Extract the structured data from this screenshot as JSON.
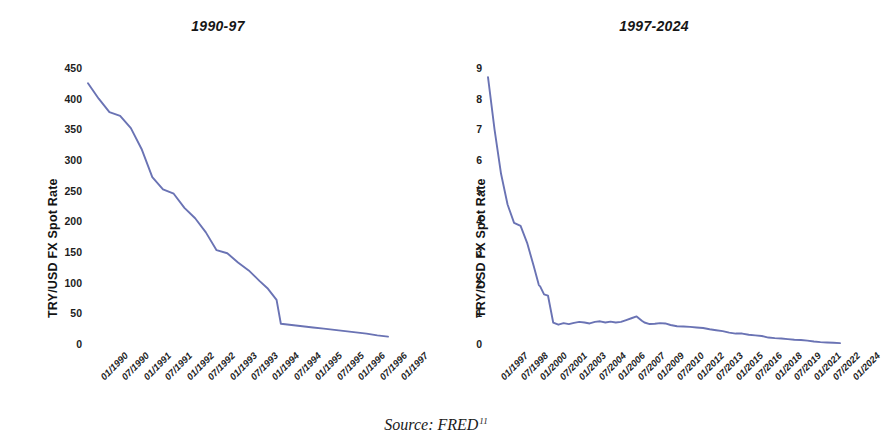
{
  "figure": {
    "source_prefix": "Source: FRED",
    "source_footnote": "11",
    "line_color": "#6a73b4"
  },
  "chart_data": [
    {
      "type": "line",
      "title": "1990-97",
      "xlabel": "",
      "ylabel": "TRY/USD FX Spot Rate",
      "ylim": [
        0,
        450
      ],
      "yticks": [
        0,
        50,
        100,
        150,
        200,
        250,
        300,
        350,
        400,
        450
      ],
      "grid": false,
      "legend": "none",
      "categories": [
        "01/1990",
        "07/1990",
        "01/1991",
        "07/1991",
        "01/1992",
        "07/1992",
        "01/1993",
        "07/1993",
        "01/1994",
        "07/1994",
        "01/1995",
        "07/1995",
        "01/1996",
        "07/1996",
        "01/1997"
      ],
      "x": [
        1990.0,
        1990.25,
        1990.5,
        1990.75,
        1991.0,
        1991.25,
        1991.5,
        1991.75,
        1992.0,
        1992.25,
        1992.5,
        1992.75,
        1993.0,
        1993.25,
        1993.5,
        1993.75,
        1994.0,
        1994.2,
        1994.4,
        1994.5,
        1994.75,
        1995.0,
        1995.25,
        1995.5,
        1995.75,
        1996.0,
        1996.25,
        1996.5,
        1996.75,
        1997.0
      ],
      "values": [
        425,
        400,
        378,
        372,
        352,
        318,
        272,
        252,
        245,
        222,
        205,
        182,
        153,
        148,
        133,
        120,
        103,
        90,
        72,
        33,
        31,
        29,
        27,
        25,
        23,
        21,
        19,
        17,
        14,
        12
      ],
      "units": "TRY per USD (pre-2005 lira)"
    },
    {
      "type": "line",
      "title": "1997-2024",
      "xlabel": "",
      "ylabel": "TRY/USD FX Spot Rate",
      "ylim": [
        0,
        9
      ],
      "yticks": [
        0,
        1,
        2,
        3,
        4,
        5,
        6,
        7,
        8,
        9
      ],
      "grid": false,
      "legend": "none",
      "categories": [
        "01/1997",
        "07/1998",
        "01/2000",
        "07/2001",
        "01/2003",
        "07/2004",
        "01/2006",
        "07/2007",
        "01/2009",
        "07/2010",
        "01/2012",
        "07/2013",
        "01/2015",
        "07/2016",
        "01/2018",
        "07/2019",
        "01/2021",
        "07/2022",
        "01/2024"
      ],
      "x": [
        1997.0,
        1997.5,
        1998.0,
        1998.5,
        1999.0,
        1999.5,
        2000.0,
        2000.5,
        2000.9,
        2001.0,
        2001.3,
        2001.6,
        2002.0,
        2002.4,
        2002.8,
        2003.2,
        2003.6,
        2004.0,
        2004.4,
        2004.8,
        2005.2,
        2005.6,
        2006.0,
        2006.4,
        2006.8,
        2007.2,
        2007.6,
        2008.0,
        2008.4,
        2008.8,
        2009.0,
        2009.4,
        2009.8,
        2010.2,
        2010.6,
        2011.0,
        2011.5,
        2012.0,
        2012.5,
        2013.0,
        2013.5,
        2014.0,
        2014.5,
        2015.0,
        2015.5,
        2016.0,
        2016.5,
        2017.0,
        2017.5,
        2018.0,
        2018.5,
        2019.0,
        2019.5,
        2020.0,
        2020.5,
        2021.0,
        2021.5,
        2022.0,
        2022.5,
        2023.0,
        2023.5,
        2024.0
      ],
      "values": [
        8.7,
        7.0,
        5.55,
        4.55,
        3.95,
        3.85,
        3.3,
        2.55,
        1.92,
        1.88,
        1.62,
        1.58,
        0.7,
        0.63,
        0.68,
        0.65,
        0.69,
        0.72,
        0.7,
        0.67,
        0.72,
        0.74,
        0.7,
        0.73,
        0.7,
        0.72,
        0.78,
        0.84,
        0.9,
        0.76,
        0.7,
        0.65,
        0.66,
        0.68,
        0.67,
        0.62,
        0.58,
        0.57,
        0.56,
        0.54,
        0.52,
        0.48,
        0.45,
        0.42,
        0.37,
        0.34,
        0.34,
        0.3,
        0.28,
        0.26,
        0.21,
        0.19,
        0.18,
        0.16,
        0.14,
        0.13,
        0.11,
        0.08,
        0.06,
        0.05,
        0.04,
        0.03
      ],
      "units": "TRY per USD (post-2005 new lira scale)"
    }
  ]
}
